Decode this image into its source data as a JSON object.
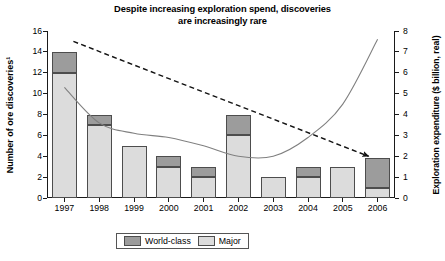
{
  "title": {
    "line1": "Despite increasing exploration spend, discoveries",
    "line2": "are increasingly rare"
  },
  "axes": {
    "left_title": "Number of ore discoveries¹",
    "right_title": "Exploration expenditure ($ billion, real)",
    "left_ticks": [
      "0",
      "2",
      "4",
      "6",
      "8",
      "10",
      "12",
      "14",
      "16"
    ],
    "right_ticks": [
      "0",
      "1",
      "2",
      "3",
      "4",
      "5",
      "6",
      "7",
      "8"
    ]
  },
  "legend": {
    "world_class": "World-class",
    "major": "Major"
  },
  "colors": {
    "world_class": "#9c9c9c",
    "major": "#dcdcdc",
    "outline": "#4d4d4d",
    "line": "#808080",
    "trend": "#111111"
  },
  "chart_data": {
    "type": "bar",
    "title": "Despite increasing exploration spend, discoveries are increasingly rare",
    "xlabel": "",
    "ylabel": "Number of ore discoveries¹",
    "y2label": "Exploration expenditure ($ billion, real)",
    "ylim": [
      0,
      16
    ],
    "y2lim": [
      0,
      8
    ],
    "grid": false,
    "legend_position": "bottom",
    "stacked": true,
    "categories": [
      "1997",
      "1998",
      "1999",
      "2000",
      "2001",
      "2002",
      "2003",
      "2004",
      "2005",
      "2006"
    ],
    "series": [
      {
        "name": "Major",
        "axis": "left",
        "values": [
          12,
          7,
          5,
          3,
          2,
          6,
          2,
          2,
          3,
          1
        ]
      },
      {
        "name": "World-class",
        "axis": "left",
        "values": [
          2,
          1,
          0,
          1,
          1,
          2,
          0,
          1,
          0,
          2.8
        ]
      }
    ],
    "totals": [
      14,
      8,
      5,
      4,
      3,
      8,
      2,
      3,
      3,
      3.8
    ],
    "lines": [
      {
        "name": "Exploration expenditure",
        "axis": "right",
        "style": "solid",
        "x": [
          "1997",
          "1998",
          "1999",
          "2000",
          "2001",
          "2002",
          "2003",
          "2004",
          "2005",
          "2006"
        ],
        "values": [
          5.3,
          3.6,
          3.1,
          2.9,
          2.5,
          2.0,
          2.0,
          2.9,
          4.5,
          7.6
        ]
      },
      {
        "name": "Discovery trend",
        "axis": "left",
        "style": "dashed-arrow",
        "x": [
          "1997",
          "2006"
        ],
        "values": [
          15.0,
          4.0
        ]
      }
    ]
  }
}
